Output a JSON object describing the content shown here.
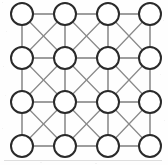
{
  "figure": {
    "width": 168,
    "height": 165,
    "background_color": "#fefefe"
  },
  "style": {
    "node_fill": "#ffffff",
    "node_stroke": "#2a2a2a",
    "node_stroke_width": 2,
    "node_radius": 11,
    "edge_color": "#7d7d7d",
    "edge_width": 1.4,
    "diagonal_edge_color": "#8a8a8a",
    "diagonal_edge_width": 1.25
  },
  "graph": {
    "rows": 4,
    "columns": 4,
    "node_count": 16,
    "column_centers_x": [
      22,
      65,
      108,
      150
    ],
    "row_centers_y": [
      14,
      58,
      102,
      146
    ],
    "nodes": [
      {
        "id": "n00",
        "row": 0,
        "col": 0,
        "cx": 22,
        "cy": 14,
        "label": ""
      },
      {
        "id": "n01",
        "row": 0,
        "col": 1,
        "cx": 65,
        "cy": 14,
        "label": ""
      },
      {
        "id": "n02",
        "row": 0,
        "col": 2,
        "cx": 108,
        "cy": 14,
        "label": ""
      },
      {
        "id": "n03",
        "row": 0,
        "col": 3,
        "cx": 150,
        "cy": 14,
        "label": ""
      },
      {
        "id": "n10",
        "row": 1,
        "col": 0,
        "cx": 22,
        "cy": 58,
        "label": ""
      },
      {
        "id": "n11",
        "row": 1,
        "col": 1,
        "cx": 65,
        "cy": 58,
        "label": ""
      },
      {
        "id": "n12",
        "row": 1,
        "col": 2,
        "cx": 108,
        "cy": 58,
        "label": ""
      },
      {
        "id": "n13",
        "row": 1,
        "col": 3,
        "cx": 150,
        "cy": 58,
        "label": ""
      },
      {
        "id": "n20",
        "row": 2,
        "col": 0,
        "cx": 22,
        "cy": 102,
        "label": ""
      },
      {
        "id": "n21",
        "row": 2,
        "col": 1,
        "cx": 65,
        "cy": 102,
        "label": ""
      },
      {
        "id": "n22",
        "row": 2,
        "col": 2,
        "cx": 108,
        "cy": 102,
        "label": ""
      },
      {
        "id": "n23",
        "row": 2,
        "col": 3,
        "cx": 150,
        "cy": 102,
        "label": ""
      },
      {
        "id": "n30",
        "row": 3,
        "col": 0,
        "cx": 22,
        "cy": 146,
        "label": ""
      },
      {
        "id": "n31",
        "row": 3,
        "col": 1,
        "cx": 65,
        "cy": 146,
        "label": ""
      },
      {
        "id": "n32",
        "row": 3,
        "col": 2,
        "cx": 108,
        "cy": 146,
        "label": ""
      },
      {
        "id": "n33",
        "row": 3,
        "col": 3,
        "cx": 150,
        "cy": 146,
        "label": ""
      }
    ],
    "edges_horizontal": [
      {
        "from": "n00",
        "to": "n01"
      },
      {
        "from": "n01",
        "to": "n02"
      },
      {
        "from": "n02",
        "to": "n03"
      },
      {
        "from": "n10",
        "to": "n11"
      },
      {
        "from": "n11",
        "to": "n12"
      },
      {
        "from": "n12",
        "to": "n13"
      },
      {
        "from": "n20",
        "to": "n21"
      },
      {
        "from": "n21",
        "to": "n22"
      },
      {
        "from": "n22",
        "to": "n23"
      },
      {
        "from": "n30",
        "to": "n31"
      },
      {
        "from": "n31",
        "to": "n32"
      },
      {
        "from": "n32",
        "to": "n33"
      }
    ],
    "edges_vertical": [
      {
        "from": "n00",
        "to": "n10"
      },
      {
        "from": "n10",
        "to": "n20"
      },
      {
        "from": "n20",
        "to": "n30"
      },
      {
        "from": "n01",
        "to": "n11"
      },
      {
        "from": "n11",
        "to": "n21"
      },
      {
        "from": "n21",
        "to": "n31"
      },
      {
        "from": "n02",
        "to": "n12"
      },
      {
        "from": "n12",
        "to": "n22"
      },
      {
        "from": "n22",
        "to": "n32"
      },
      {
        "from": "n03",
        "to": "n13"
      },
      {
        "from": "n13",
        "to": "n23"
      },
      {
        "from": "n23",
        "to": "n33"
      }
    ],
    "edges_diagonal": [
      {
        "from": "n00",
        "to": "n11"
      },
      {
        "from": "n01",
        "to": "n10"
      },
      {
        "from": "n01",
        "to": "n12"
      },
      {
        "from": "n02",
        "to": "n11"
      },
      {
        "from": "n02",
        "to": "n13"
      },
      {
        "from": "n03",
        "to": "n12"
      },
      {
        "from": "n10",
        "to": "n21"
      },
      {
        "from": "n11",
        "to": "n20"
      },
      {
        "from": "n11",
        "to": "n22"
      },
      {
        "from": "n12",
        "to": "n21"
      },
      {
        "from": "n12",
        "to": "n23"
      },
      {
        "from": "n13",
        "to": "n22"
      },
      {
        "from": "n20",
        "to": "n31"
      },
      {
        "from": "n21",
        "to": "n30"
      },
      {
        "from": "n21",
        "to": "n32"
      },
      {
        "from": "n22",
        "to": "n31"
      },
      {
        "from": "n22",
        "to": "n33"
      },
      {
        "from": "n23",
        "to": "n32"
      }
    ],
    "edge_counts": {
      "horizontal": 12,
      "vertical": 12,
      "diagonal": 18,
      "total": 42
    }
  }
}
